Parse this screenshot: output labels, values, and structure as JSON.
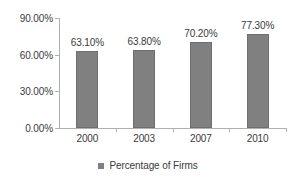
{
  "chart_data": {
    "type": "bar",
    "title": "",
    "subtitle": "",
    "xlabel": "",
    "ylabel": "",
    "categories": [
      "2000",
      "2003",
      "2007",
      "2010"
    ],
    "series": [
      {
        "name": "Percentage of Firms",
        "values": [
          63.1,
          63.8,
          70.2,
          77.3
        ],
        "value_labels": [
          "63.10%",
          "63.80%",
          "70.20%",
          "77.30%"
        ],
        "color": "#808080"
      }
    ],
    "ylim": [
      0,
      90
    ],
    "yticks": [
      0,
      30,
      60,
      90
    ],
    "ytick_labels": [
      "0.00%",
      "30.00%",
      "60.00%",
      "90.00%"
    ],
    "grid": false,
    "legend_position": "bottom"
  },
  "legend": {
    "entries": [
      {
        "label": "Percentage of Firms",
        "color": "#808080"
      }
    ]
  },
  "colors": {
    "bar_fill": "#808080",
    "bar_border": "#6e6e6e",
    "axis_line": "#b0b0b0",
    "text": "#3a3a3a",
    "background": "#ffffff"
  }
}
